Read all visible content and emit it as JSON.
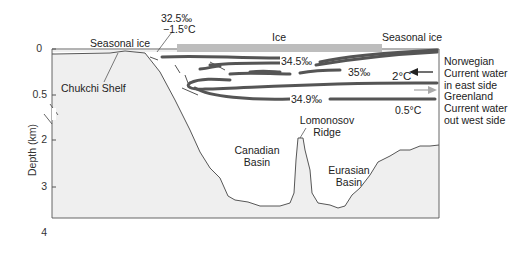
{
  "diagram": {
    "type": "cross-section",
    "y_axis": {
      "label": "Depth (km)",
      "ticks": [
        "0",
        "0.5",
        "2",
        "3",
        "4"
      ],
      "note": "axis break between 0.5 and 2 km"
    },
    "surface_labels": {
      "seasonal_ice_left": "Seasonal ice",
      "ice": "Ice",
      "seasonal_ice_right": "Seasonal ice"
    },
    "water_labels": {
      "inflow_salinity": "32.5‰",
      "inflow_temp": "−1.5°C",
      "salinity_345": "34.5‰",
      "salinity_35": "35‰",
      "salinity_349": "34.9‰",
      "temp_2": "2°C",
      "temp_05": "0.5°C"
    },
    "seafloor_labels": {
      "chukchi": "Chukchi Shelf",
      "canadian_line1": "Canadian",
      "canadian_line2": "Basin",
      "lomonosov_line1": "Lomonosov",
      "lomonosov_line2": "Ridge",
      "eurasian_line1": "Eurasian",
      "eurasian_line2": "Basin"
    },
    "legend": {
      "norwegian_line1": "Norwegian",
      "norwegian_line2": "Current water",
      "norwegian_line3": "in east side",
      "greenland_line1": "Greenland",
      "greenland_line2": "Current water",
      "greenland_line3": "out west side"
    },
    "colors": {
      "seafloor": "#eeeeee",
      "water": "#ffffff",
      "ice": "#bdbdbd",
      "current": "#555555",
      "outflow_arrow": "#aaaaaa"
    }
  }
}
